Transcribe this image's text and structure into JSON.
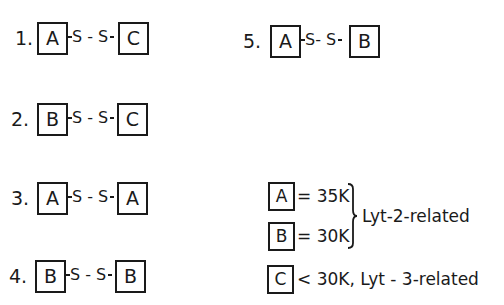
{
  "diagram": {
    "combinations": [
      {
        "number": "1.",
        "left": "A",
        "link": "S - S",
        "right": "C"
      },
      {
        "number": "2.",
        "left": "B",
        "link": "S - S",
        "right": "C"
      },
      {
        "number": "3.",
        "left": "A",
        "link": "S - S",
        "right": "A"
      },
      {
        "number": "4.",
        "left": "B",
        "link": "S - S",
        "right": "B"
      },
      {
        "number": "5.",
        "left": "A",
        "link": "S- S",
        "right": "B"
      }
    ],
    "legend": {
      "items": [
        {
          "label": "A",
          "value": "= 35K"
        },
        {
          "label": "B",
          "value": "= 30K"
        },
        {
          "label": "C",
          "value": "< 30K, Lyt - 3-related"
        }
      ],
      "group_label": "Lyt-2-related"
    }
  }
}
